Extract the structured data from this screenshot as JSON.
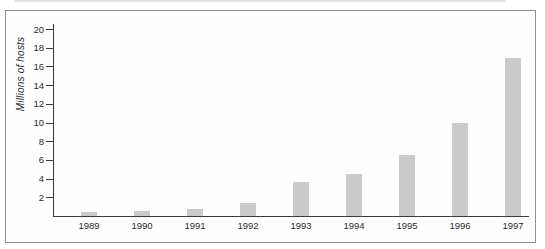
{
  "chart_data": {
    "type": "bar",
    "categories": [
      "1989",
      "1990",
      "1991",
      "1992",
      "1993",
      "1994",
      "1995",
      "1996",
      "1997"
    ],
    "values": [
      0.4,
      0.5,
      0.7,
      1.4,
      3.6,
      4.5,
      6.5,
      9.9,
      16.9
    ],
    "title": "",
    "xlabel": "",
    "ylabel": "Millions of hosts",
    "ylim": [
      0,
      20.7
    ],
    "yticks": [
      2,
      4,
      6,
      8,
      10,
      12,
      14,
      16,
      18,
      20
    ],
    "grid": false,
    "legend": null,
    "bar_color": "#cbcbcb",
    "axis_color": "#3c3c3c",
    "frame_border_color": "#8f8f8f",
    "text_color": "#2b2b2b"
  },
  "layout": {
    "axis_x": 53,
    "baseline_y": 216.5,
    "px_per_unit": 9.35,
    "first_bar_center_x": 89,
    "bar_spacing": 53,
    "bar_width": 16
  }
}
